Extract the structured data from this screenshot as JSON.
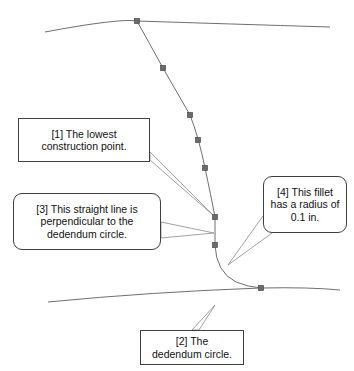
{
  "diagram": {
    "stroke_color": "#6f6f6f",
    "marker_color": "#6b6b6b",
    "callout_border_color": "#3f3f3f",
    "background_color": "#ffffff"
  },
  "callouts": [
    {
      "id": "1",
      "name": "lowest-construction-point",
      "shape": "rectangle",
      "lines": [
        "[1] The lowest",
        "construction point."
      ]
    },
    {
      "id": "2",
      "name": "dedendum-circle",
      "shape": "rectangle",
      "lines": [
        "[2] The",
        "dedendum circle."
      ]
    },
    {
      "id": "3",
      "name": "perpendicular-straight-line",
      "shape": "rounded-rectangle",
      "lines": [
        "[3] This straight line is",
        "perpendicular to the",
        "dedendum circle."
      ]
    },
    {
      "id": "4",
      "name": "fillet-radius",
      "shape": "rounded-rectangle",
      "lines": [
        "[4] This fillet",
        "has a radius of",
        "0.1 in."
      ]
    }
  ],
  "geometry": {
    "upper_dedendum_arc": "M 45,32 Q 120,18 137,21 Q 230,24 330,27",
    "lower_dedendum_arc": "M 48,302 Q 150,292 261,288 Q 310,287 340,290",
    "involute_curve": "M 137,21 L 163,68 L 190,115 Q 199,138 205,168 Q 211,196 215,217",
    "straight_line": "M 215,217 L 215,245",
    "fillet_arc": "M 215,245 Q 216,272 236,282 Q 248,287 261,288",
    "construction_points": [
      {
        "x": 137,
        "y": 21,
        "label": "top-profile-point"
      },
      {
        "x": 163,
        "y": 68,
        "label": "profile-point-2"
      },
      {
        "x": 190,
        "y": 115,
        "label": "profile-point-3"
      },
      {
        "x": 198,
        "y": 140,
        "label": "profile-point-4"
      },
      {
        "x": 205,
        "y": 168,
        "label": "profile-point-5"
      },
      {
        "x": 215,
        "y": 217,
        "label": "lowest-construction-point"
      },
      {
        "x": 215,
        "y": 245,
        "label": "tangency-point"
      },
      {
        "x": 261,
        "y": 288,
        "label": "fillet-end-point"
      }
    ],
    "leaders": {
      "callout_1": "M 150,160 L 214,216 L 150,152 Z",
      "callout_2": "M 192,330 L 215,305 L 199,330 Z",
      "callout_3": "M 161,222 L 214,233 L 161,238 Z",
      "callout_4": "M 263,216 L 228,265 L 272,233 Z"
    }
  }
}
